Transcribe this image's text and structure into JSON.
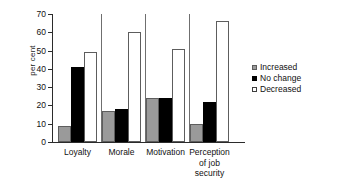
{
  "chart_data": {
    "type": "bar",
    "title": "",
    "xlabel": "",
    "ylabel": "per cent",
    "ylim": [
      0,
      70
    ],
    "yticks": [
      0,
      10,
      20,
      30,
      40,
      50,
      60,
      70
    ],
    "grid": false,
    "legend_position": "right",
    "categories": [
      "Loyalty",
      "Morale",
      "Motivation",
      "Perception of job security"
    ],
    "category_label_lines": [
      [
        "Loyalty"
      ],
      [
        "Morale"
      ],
      [
        "Motivation"
      ],
      [
        "Perception",
        "of job",
        "security"
      ]
    ],
    "series": [
      {
        "name": "Increased",
        "color": "#9a9a9a",
        "values": [
          9,
          17,
          24,
          10
        ]
      },
      {
        "name": "No change",
        "color": "#000000",
        "values": [
          41,
          18,
          24,
          22
        ]
      },
      {
        "name": "Decreased",
        "color": "#ffffff",
        "values": [
          49,
          60,
          51,
          66
        ]
      }
    ]
  },
  "legend": {
    "items": [
      {
        "label": "Increased"
      },
      {
        "label": "No change"
      },
      {
        "label": "Decreased"
      }
    ]
  }
}
